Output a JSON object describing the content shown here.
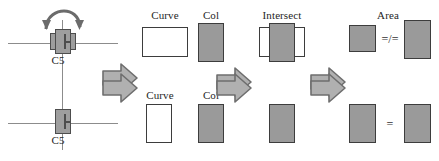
{
  "figure": {
    "type": "diagram",
    "background_color": "#ffffff",
    "fill_gray": "#9a9a9a",
    "stroke_dark": "#3d3d3d",
    "axis_gray": "#8c8c8c"
  },
  "rows": [
    {
      "id": "top",
      "node": {
        "label": "C5",
        "rotation_icon": "curved-rotation-arrow",
        "has_rotation": true
      },
      "step_curve": {
        "label": "Curve",
        "shape": "rectangle",
        "fill": "white",
        "orientation": "landscape"
      },
      "step_col": {
        "label": "Col",
        "shape": "rectangle",
        "fill": "gray",
        "orientation": "portrait"
      },
      "step_intersect": {
        "label": "Intersect",
        "shape": "overlapping-rectangles",
        "fill": "gray"
      },
      "step_area": {
        "label": "Area",
        "left_shape": {
          "shape": "rectangle",
          "fill": "gray",
          "orientation": "square"
        },
        "operator": "=/=",
        "operator_meaning": "not-equal",
        "right_shape": {
          "shape": "rectangle",
          "fill": "gray",
          "orientation": "portrait"
        }
      },
      "arrows": [
        "block-arrow-right",
        "block-arrow-right",
        "block-arrow-right"
      ]
    },
    {
      "id": "bottom",
      "node": {
        "label": "C5",
        "rotation_icon": "",
        "has_rotation": false
      },
      "step_curve": {
        "label": "Curve",
        "shape": "rectangle",
        "fill": "white",
        "orientation": "portrait"
      },
      "step_col": {
        "label": "Col",
        "shape": "rectangle",
        "fill": "gray",
        "orientation": "portrait"
      },
      "step_intersect": {
        "label": "",
        "shape": "rectangle",
        "fill": "gray"
      },
      "step_area": {
        "label": "",
        "left_shape": {
          "shape": "rectangle",
          "fill": "gray",
          "orientation": "portrait"
        },
        "operator": "=",
        "operator_meaning": "equal",
        "right_shape": {
          "shape": "rectangle",
          "fill": "gray",
          "orientation": "portrait"
        }
      },
      "arrows": [
        "block-arrow-right",
        "block-arrow-right",
        "block-arrow-right"
      ]
    }
  ]
}
